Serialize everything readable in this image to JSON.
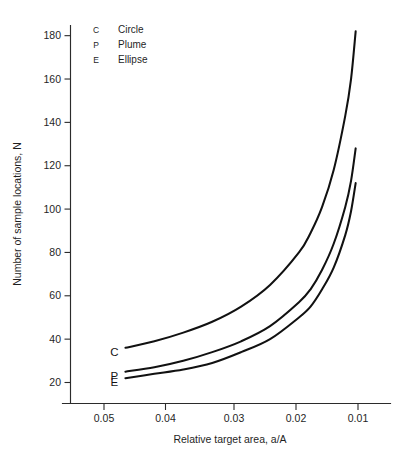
{
  "chart_data": {
    "type": "line",
    "title": "",
    "xlabel": "Relative target area, a/A",
    "ylabel": "Number of sample locations, N",
    "xticks": [
      "0.05",
      "0.04",
      "0.03",
      "0.02",
      "0.01"
    ],
    "xtick_values": [
      0.05,
      0.04,
      0.03,
      0.02,
      0.01
    ],
    "yticks": [
      "20",
      "40",
      "60",
      "80",
      "100",
      "120",
      "140",
      "160",
      "180"
    ],
    "ytick_values": [
      20,
      40,
      60,
      80,
      100,
      120,
      140,
      160,
      180
    ],
    "xlim": [
      0.055,
      0.0085
    ],
    "ylim": [
      14,
      184
    ],
    "x_axis_reversed": true,
    "grid": false,
    "legend_position": "top-left-inside",
    "x": [
      0.05,
      0.045,
      0.04,
      0.035,
      0.03,
      0.025,
      0.02,
      0.018,
      0.016,
      0.014,
      0.012,
      0.011,
      0.0102
    ],
    "series": [
      {
        "name": "Circle",
        "key": "C",
        "label_at_start": "C",
        "values": [
          36,
          39,
          43,
          48,
          55,
          65,
          80,
          89,
          101,
          118,
          143,
          160,
          182
        ]
      },
      {
        "name": "Plume",
        "key": "P",
        "label_at_start": "P",
        "values": [
          25,
          27,
          30,
          34,
          39,
          46,
          57,
          63,
          72,
          84,
          101,
          113,
          128
        ]
      },
      {
        "name": "Ellipse",
        "key": "E",
        "label_at_start": "E",
        "values": [
          22,
          24,
          26,
          29,
          34,
          40,
          50,
          55,
          63,
          73,
          88,
          99,
          112
        ]
      }
    ],
    "legend": [
      {
        "key": "C",
        "label": "Circle"
      },
      {
        "key": "P",
        "label": "Plume"
      },
      {
        "key": "E",
        "label": "Ellipse"
      }
    ],
    "colors": {
      "curve": "#111111",
      "axis": "#2b2b2b",
      "background": "#ffffff",
      "text": "#1f1f1f"
    }
  }
}
